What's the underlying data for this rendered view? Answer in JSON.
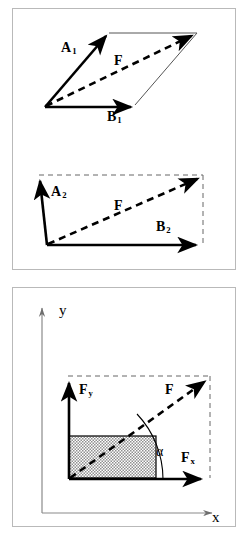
{
  "figure": {
    "background_color": "#ffffff",
    "panel_border_color": "#b9b9b9",
    "vector_color": "#000000",
    "axis_color": "#8a8a8a",
    "shade_color": "#a8a8a8"
  },
  "panels": [
    {
      "id": "parallelogram-panel",
      "diagrams": [
        {
          "id": "parallelogram-diagram",
          "type": "vector-parallelogram",
          "labels": [
            {
              "name": "label-a1",
              "base": "A",
              "sub": "1"
            },
            {
              "name": "label-b1",
              "base": "B",
              "sub": "1"
            },
            {
              "name": "label-f1",
              "base": "F",
              "sub": ""
            }
          ]
        },
        {
          "id": "triangle-diagram",
          "type": "vector-triangle",
          "labels": [
            {
              "name": "label-a2",
              "base": "A",
              "sub": "2"
            },
            {
              "name": "label-b2",
              "base": "B",
              "sub": "2"
            },
            {
              "name": "label-f2",
              "base": "F",
              "sub": ""
            }
          ]
        }
      ]
    },
    {
      "id": "components-panel",
      "diagrams": [
        {
          "id": "cartesian-components-diagram",
          "type": "cartesian-vector-components",
          "labels": [
            {
              "name": "label-axis-y",
              "base": "y",
              "sub": ""
            },
            {
              "name": "label-axis-x",
              "base": "x",
              "sub": ""
            },
            {
              "name": "label-fy",
              "base": "F",
              "sub": "y"
            },
            {
              "name": "label-fx",
              "base": "F",
              "sub": "x"
            },
            {
              "name": "label-f3",
              "base": "F",
              "sub": ""
            },
            {
              "name": "label-alpha",
              "base": "α",
              "sub": ""
            }
          ]
        }
      ]
    }
  ]
}
